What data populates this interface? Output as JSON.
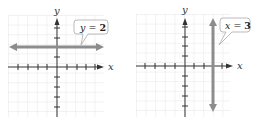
{
  "figures": [
    {
      "name": "horizontal-line-graph",
      "callout": {
        "lhs": "y",
        "eq": " = ",
        "rhs": "2"
      },
      "axis_labels": {
        "x": "x",
        "y": "y"
      },
      "line": {
        "type": "horizontal",
        "equation": "y = 2",
        "value": 2
      }
    },
    {
      "name": "vertical-line-graph",
      "callout": {
        "lhs": "x",
        "eq": " = ",
        "rhs": "3"
      },
      "axis_labels": {
        "x": "x",
        "y": "y"
      },
      "line": {
        "type": "vertical",
        "equation": "x = 3",
        "value": 3
      }
    }
  ],
  "colors": {
    "grid": "#e6e6e6",
    "axis": "#333333",
    "line": "#8c8c8c",
    "callout_border": "#aaaaaa"
  }
}
